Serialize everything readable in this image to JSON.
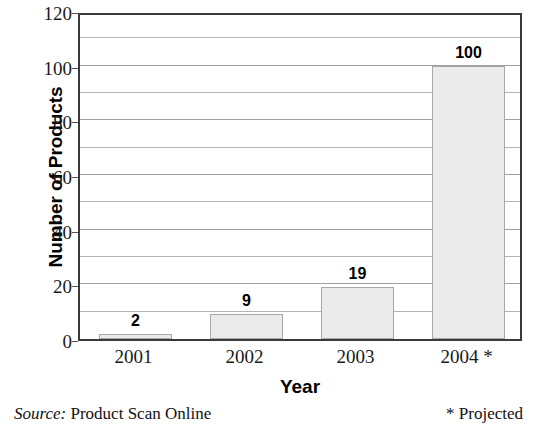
{
  "chart_data": {
    "type": "bar",
    "title": "",
    "categories": [
      "2001",
      "2002",
      "2003",
      "2004 *"
    ],
    "values": [
      2,
      9,
      19,
      100
    ],
    "data_labels": [
      "2",
      "9",
      "19",
      "100"
    ],
    "xlabel": "Year",
    "ylabel": "Number of Products",
    "ylim": [
      0,
      120
    ],
    "ytick_labels": [
      "0",
      "20",
      "40",
      "60",
      "80",
      "100",
      "120"
    ],
    "ytick_values": [
      0,
      20,
      40,
      60,
      80,
      100,
      120
    ],
    "gridline_interval": 10,
    "grid": true,
    "legend": "none",
    "bar_fill_color": "#ebebeb",
    "bar_border_color": "#a8a8a8",
    "axis_color": "#3a3a3a",
    "gridline_color": "#b4b4b4",
    "text_color": "#000000"
  },
  "footnotes": {
    "source_label": "Source:",
    "source_value": "Product Scan Online",
    "projected_note": "* Projected"
  }
}
